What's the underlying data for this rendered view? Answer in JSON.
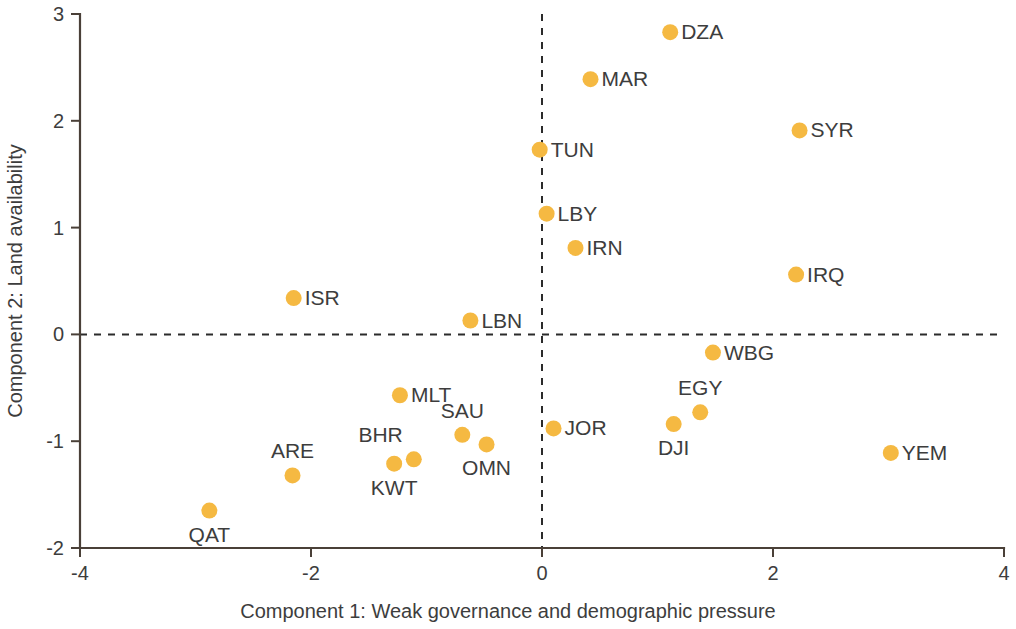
{
  "chart_data": {
    "type": "scatter",
    "title": "",
    "xlabel": "Component 1: Weak governance and demographic pressure",
    "ylabel": "Component 2: Land availability",
    "xlim": [
      -4,
      4
    ],
    "ylim": [
      -2,
      3
    ],
    "xticks": [
      "-4",
      "-2",
      "0",
      "2",
      "4"
    ],
    "xtick_values": [
      -4,
      -2,
      0,
      2,
      4
    ],
    "yticks": [
      "3",
      "2",
      "1",
      "0",
      "-1",
      "-2"
    ],
    "ytick_values": [
      3,
      2,
      1,
      0,
      -1,
      -2
    ],
    "grid": false,
    "legend": "none",
    "reference_lines": [
      {
        "axis": "x",
        "value": 0,
        "style": "dashed"
      },
      {
        "axis": "y",
        "value": 0,
        "style": "dashed"
      }
    ],
    "marker_color": "#f5b942",
    "points": [
      {
        "label": "DZA",
        "x": 1.11,
        "y": 2.83,
        "label_pos": "right"
      },
      {
        "label": "MAR",
        "x": 0.42,
        "y": 2.39,
        "label_pos": "right"
      },
      {
        "label": "SYR",
        "x": 2.23,
        "y": 1.91,
        "label_pos": "right"
      },
      {
        "label": "TUN",
        "x": -0.02,
        "y": 1.73,
        "label_pos": "right"
      },
      {
        "label": "LBY",
        "x": 0.04,
        "y": 1.13,
        "label_pos": "right"
      },
      {
        "label": "IRN",
        "x": 0.29,
        "y": 0.81,
        "label_pos": "right"
      },
      {
        "label": "IRQ",
        "x": 2.2,
        "y": 0.56,
        "label_pos": "right"
      },
      {
        "label": "ISR",
        "x": -2.15,
        "y": 0.34,
        "label_pos": "right"
      },
      {
        "label": "LBN",
        "x": -0.62,
        "y": 0.13,
        "label_pos": "right"
      },
      {
        "label": "WBG",
        "x": 1.48,
        "y": -0.17,
        "label_pos": "right"
      },
      {
        "label": "MLT",
        "x": -1.23,
        "y": -0.57,
        "label_pos": "right"
      },
      {
        "label": "EGY",
        "x": 1.37,
        "y": -0.73,
        "label_pos": "above"
      },
      {
        "label": "DJI",
        "x": 1.14,
        "y": -0.84,
        "label_pos": "below"
      },
      {
        "label": "JOR",
        "x": 0.1,
        "y": -0.88,
        "label_pos": "right"
      },
      {
        "label": "SAU",
        "x": -0.69,
        "y": -0.94,
        "label_pos": "above"
      },
      {
        "label": "OMN",
        "x": -0.48,
        "y": -1.03,
        "label_pos": "below"
      },
      {
        "label": "YEM",
        "x": 3.02,
        "y": -1.11,
        "label_pos": "right"
      },
      {
        "label": "BHR",
        "x": -1.11,
        "y": -1.17,
        "label_pos": "above-left"
      },
      {
        "label": "KWT",
        "x": -1.28,
        "y": -1.21,
        "label_pos": "below"
      },
      {
        "label": "ARE",
        "x": -2.16,
        "y": -1.32,
        "label_pos": "above"
      },
      {
        "label": "QAT",
        "x": -2.88,
        "y": -1.65,
        "label_pos": "below"
      }
    ]
  }
}
